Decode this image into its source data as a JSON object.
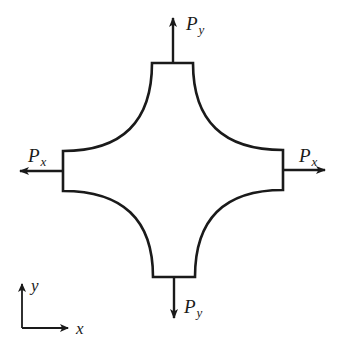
{
  "diagram": {
    "type": "cruciform specimen under biaxial loading",
    "stroke_color": "#1a1a1a",
    "background_color": "#ffffff",
    "loads": {
      "top": {
        "symbol": "P",
        "subscript": "y",
        "direction": "up"
      },
      "bottom": {
        "symbol": "P",
        "subscript": "y",
        "direction": "down"
      },
      "left": {
        "symbol": "P",
        "subscript": "x",
        "direction": "left"
      },
      "right": {
        "symbol": "P",
        "subscript": "x",
        "direction": "right"
      }
    },
    "axes": {
      "x_label": "x",
      "y_label": "y"
    }
  }
}
